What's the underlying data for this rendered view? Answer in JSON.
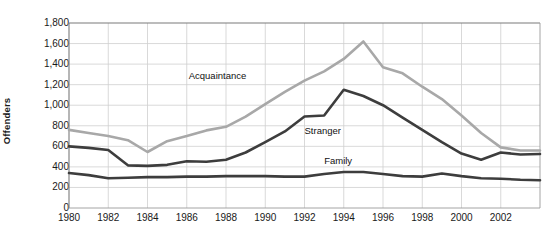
{
  "chart_data": {
    "type": "line",
    "title": "",
    "subtitle": "",
    "xlabel": "",
    "ylabel": "Offenders",
    "xlim": [
      1980,
      2004
    ],
    "ylim": [
      0,
      1800
    ],
    "grid": true,
    "legend_position": "inline-annotations",
    "x": [
      1980,
      1981,
      1982,
      1983,
      1984,
      1985,
      1986,
      1987,
      1988,
      1989,
      1990,
      1991,
      1992,
      1993,
      1994,
      1995,
      1996,
      1997,
      1998,
      1999,
      2000,
      2001,
      2002,
      2003,
      2004
    ],
    "xticks": [
      "1980",
      "1982",
      "1984",
      "1986",
      "1988",
      "1990",
      "1992",
      "1994",
      "1996",
      "1998",
      "2000",
      "2002"
    ],
    "xtick_values": [
      1980,
      1982,
      1984,
      1986,
      1988,
      1990,
      1992,
      1994,
      1996,
      1998,
      2000,
      2002
    ],
    "yticks": [
      "0",
      "200",
      "400",
      "600",
      "800",
      "1,000",
      "1,200",
      "1,400",
      "1,600",
      "1,800"
    ],
    "ytick_values": [
      0,
      200,
      400,
      600,
      800,
      1000,
      1200,
      1400,
      1600,
      1800
    ],
    "series": [
      {
        "name": "Acquaintance",
        "color": "#a8a8a8",
        "label_x": 1986.1,
        "label_y": 1285,
        "values": [
          760,
          730,
          700,
          660,
          545,
          650,
          700,
          755,
          790,
          890,
          1010,
          1130,
          1240,
          1330,
          1450,
          1620,
          1370,
          1310,
          1180,
          1060,
          900,
          730,
          590,
          560,
          560
        ]
      },
      {
        "name": "Stranger",
        "color": "#3d3d3d",
        "label_x": 1992.0,
        "label_y": 745,
        "values": [
          600,
          585,
          565,
          415,
          410,
          420,
          455,
          450,
          470,
          540,
          640,
          745,
          890,
          900,
          1150,
          1090,
          1000,
          880,
          760,
          640,
          530,
          470,
          540,
          520,
          525
        ]
      },
      {
        "name": "Family",
        "color": "#3d3d3d",
        "label_x": 1993.0,
        "label_y": 455,
        "values": [
          340,
          320,
          290,
          295,
          300,
          300,
          305,
          305,
          310,
          310,
          310,
          305,
          305,
          330,
          350,
          350,
          330,
          310,
          305,
          335,
          310,
          290,
          285,
          275,
          270
        ]
      }
    ]
  }
}
